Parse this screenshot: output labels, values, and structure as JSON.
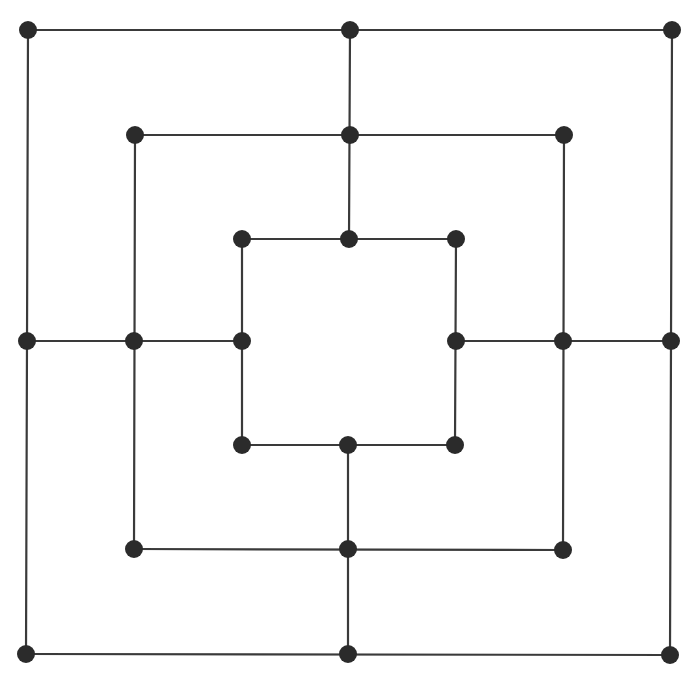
{
  "game": "Nine Men's Morris",
  "colors": {
    "line": "#3a3a3a",
    "point": "#2b2b2b",
    "background": "#ffffff"
  },
  "point_radius": 9,
  "points": [
    {
      "id": "outer-top-left",
      "x": 28,
      "y": 30
    },
    {
      "id": "outer-top-middle",
      "x": 350,
      "y": 30
    },
    {
      "id": "outer-top-right",
      "x": 672,
      "y": 30
    },
    {
      "id": "middle-top-left",
      "x": 135,
      "y": 135
    },
    {
      "id": "middle-top-middle",
      "x": 350,
      "y": 135
    },
    {
      "id": "middle-top-right",
      "x": 564,
      "y": 135
    },
    {
      "id": "inner-top-left",
      "x": 242,
      "y": 239
    },
    {
      "id": "inner-top-middle",
      "x": 349,
      "y": 239
    },
    {
      "id": "inner-top-right",
      "x": 456,
      "y": 239
    },
    {
      "id": "outer-middle-left",
      "x": 27,
      "y": 341
    },
    {
      "id": "middle-middle-left",
      "x": 134,
      "y": 341
    },
    {
      "id": "inner-middle-left",
      "x": 242,
      "y": 341
    },
    {
      "id": "inner-middle-right",
      "x": 456,
      "y": 341
    },
    {
      "id": "middle-middle-right",
      "x": 563,
      "y": 341
    },
    {
      "id": "outer-middle-right",
      "x": 671,
      "y": 341
    },
    {
      "id": "inner-bottom-left",
      "x": 242,
      "y": 445
    },
    {
      "id": "inner-bottom-middle",
      "x": 348,
      "y": 445
    },
    {
      "id": "inner-bottom-right",
      "x": 455,
      "y": 445
    },
    {
      "id": "middle-bottom-left",
      "x": 134,
      "y": 549
    },
    {
      "id": "middle-bottom-middle",
      "x": 348,
      "y": 549
    },
    {
      "id": "middle-bottom-right",
      "x": 563,
      "y": 550
    },
    {
      "id": "outer-bottom-left",
      "x": 26,
      "y": 654
    },
    {
      "id": "outer-bottom-middle",
      "x": 348,
      "y": 654
    },
    {
      "id": "outer-bottom-right",
      "x": 670,
      "y": 655
    }
  ],
  "lines": [
    [
      28,
      30,
      672,
      30
    ],
    [
      672,
      30,
      670,
      655
    ],
    [
      670,
      655,
      26,
      654
    ],
    [
      26,
      654,
      28,
      30
    ],
    [
      135,
      135,
      564,
      135
    ],
    [
      564,
      135,
      563,
      550
    ],
    [
      563,
      550,
      134,
      549
    ],
    [
      134,
      549,
      135,
      135
    ],
    [
      242,
      239,
      456,
      239
    ],
    [
      456,
      239,
      455,
      445
    ],
    [
      455,
      445,
      242,
      445
    ],
    [
      242,
      445,
      242,
      239
    ],
    [
      350,
      30,
      349,
      239
    ],
    [
      348,
      445,
      348,
      654
    ],
    [
      27,
      341,
      242,
      341
    ],
    [
      456,
      341,
      671,
      341
    ]
  ]
}
